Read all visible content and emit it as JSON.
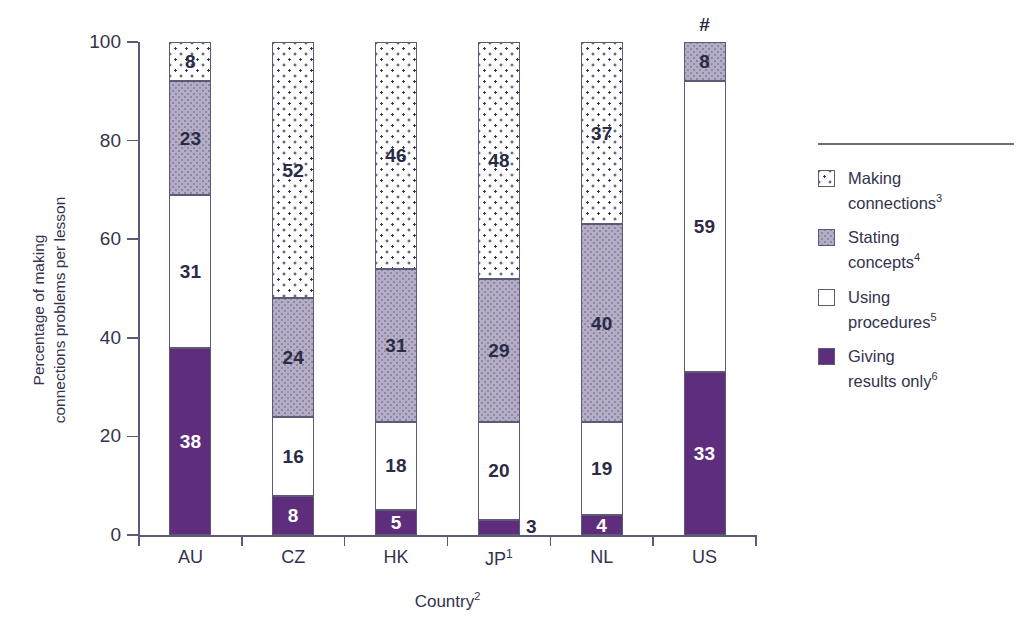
{
  "chart_data": {
    "type": "bar",
    "subtype": "stacked-bar-100",
    "title": "",
    "xlabel": "Country",
    "xlabel_superscript": "2",
    "ylabel_line1": "Percentage of making",
    "ylabel_line2": "connections problems per lesson",
    "ylim": [
      0,
      100
    ],
    "yticks": [
      0,
      20,
      40,
      60,
      80,
      100
    ],
    "grid": false,
    "legend_position": "right",
    "categories": [
      "AU",
      "CZ",
      "HK",
      "JP",
      "NL",
      "US"
    ],
    "category_superscripts": [
      "",
      "",
      "",
      "1",
      "",
      ""
    ],
    "series": [
      {
        "name": "Giving results only",
        "superscript": "6",
        "fill": "fill-solid",
        "color": "#5e2d7c",
        "values": [
          38,
          8,
          5,
          3,
          4,
          33
        ],
        "label_outside": [
          false,
          false,
          false,
          true,
          false,
          false
        ]
      },
      {
        "name": "Using procedures",
        "superscript": "5",
        "fill": "fill-plain",
        "color": "#ffffff",
        "values": [
          31,
          16,
          18,
          20,
          19,
          59
        ],
        "label_outside": [
          false,
          false,
          false,
          false,
          false,
          false
        ]
      },
      {
        "name": "Stating concepts",
        "superscript": "4",
        "fill": "fill-gray",
        "color": "#b4adc5",
        "values": [
          23,
          24,
          31,
          29,
          40,
          8
        ],
        "label_outside": [
          false,
          false,
          false,
          false,
          false,
          false
        ]
      },
      {
        "name": "Making connections",
        "superscript": "3",
        "fill": "fill-dotted",
        "color": "#ffffff",
        "values": [
          8,
          52,
          46,
          48,
          37,
          null
        ],
        "label_outside": [
          false,
          false,
          false,
          false,
          false,
          false
        ]
      }
    ],
    "annotations": [
      {
        "category": "US",
        "text": "#",
        "position": "above-bar"
      }
    ]
  },
  "legend": {
    "items": [
      {
        "label": "Making connections",
        "superscript": "3",
        "fill": "fill-dotted"
      },
      {
        "label": "Stating concepts",
        "superscript": "4",
        "fill": "fill-gray"
      },
      {
        "label": "Using procedures",
        "superscript": "5",
        "fill": "fill-plain"
      },
      {
        "label": "Giving results only",
        "superscript": "6",
        "fill": "fill-solid"
      }
    ]
  }
}
